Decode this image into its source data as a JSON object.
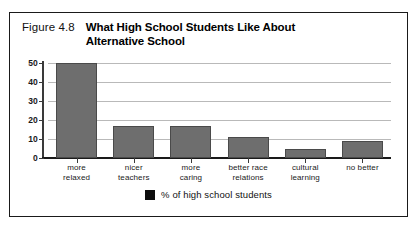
{
  "figure": {
    "number": "Figure 4.8",
    "title": "What High School Students Like About Alternative School"
  },
  "legend": {
    "swatch_color": "#0d0d0d",
    "label": "% of high school students"
  },
  "style": {
    "bar_fill": "#6e6e6e",
    "bar_stroke": "#4a4a4a",
    "gridline_color": "#b9b9b9",
    "axis_color": "#1a1a1a",
    "frame_color": "#1a1a1a",
    "background": "#ffffff"
  },
  "chart_data": {
    "type": "bar",
    "title": "What High School Students Like About Alternative School",
    "xlabel": "",
    "ylabel": "",
    "ylim": [
      0,
      50
    ],
    "yticks": [
      0,
      10,
      20,
      30,
      40,
      50
    ],
    "ytick_labels": [
      "0",
      "10",
      "20",
      "30",
      "40",
      "50"
    ],
    "grid": true,
    "legend_position": "bottom-center",
    "categories": [
      "more relaxed",
      "nicer teachers",
      "more caring",
      "better race relations",
      "cultural learning",
      "no better"
    ],
    "category_lines": [
      [
        "more",
        "relaxed"
      ],
      [
        "nicer",
        "teachers"
      ],
      [
        "more",
        "caring"
      ],
      [
        "better race",
        "relations"
      ],
      [
        "cultural",
        "learning"
      ],
      [
        "no better"
      ]
    ],
    "series": [
      {
        "name": "% of high school students",
        "values": [
          50,
          17,
          17,
          11,
          5,
          9
        ]
      }
    ]
  }
}
